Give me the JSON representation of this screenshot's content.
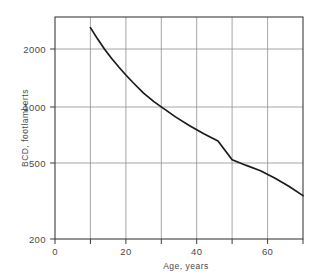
{
  "chart_data": {
    "type": "line",
    "title": "",
    "xlabel": "Age, years",
    "ylabel": "BCD, footlamberts",
    "xscale": "linear",
    "yscale": "log",
    "xlim": [
      0,
      70
    ],
    "ylim": [
      200,
      2600
    ],
    "grid": true,
    "legend": false,
    "xticks": [
      0,
      20,
      40,
      60
    ],
    "xticklabels": [
      "0",
      "20",
      "40",
      "60"
    ],
    "xminorticks": [
      10,
      30,
      50,
      70
    ],
    "yticks": [
      200,
      500,
      1000,
      2000
    ],
    "yticklabels": [
      "200",
      "500",
      "1000",
      "2000"
    ],
    "series": [
      {
        "name": "BCD",
        "x": [
          10,
          12,
          14,
          16,
          18,
          20,
          22,
          25,
          28,
          30,
          34,
          38,
          42,
          46,
          50,
          54,
          58,
          62,
          66,
          70
        ],
        "values": [
          2300,
          2020,
          1790,
          1610,
          1460,
          1330,
          1220,
          1080,
          975,
          920,
          820,
          740,
          675,
          620,
          500,
          468,
          440,
          405,
          368,
          330
        ]
      }
    ],
    "line_color": "#1a1a1a",
    "grid_color": "#8a8a8a",
    "axis_color": "#3c3c3c",
    "background": "#ffffff"
  },
  "axes": {
    "x_title": "Age, years",
    "y_title": "BCD, footlamberts"
  },
  "xtick_labels": {
    "t0": "0",
    "t1": "20",
    "t2": "40",
    "t3": "60"
  },
  "ytick_labels": {
    "t0": "200",
    "t1": "500",
    "t2": "1000",
    "t3": "2000"
  }
}
